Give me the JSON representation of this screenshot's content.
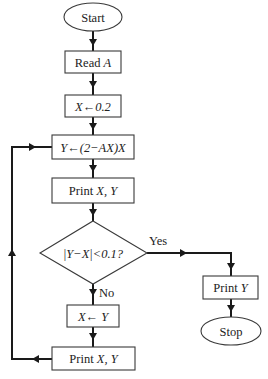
{
  "diagram": {
    "type": "flowchart",
    "nodes": {
      "start": {
        "shape": "terminal",
        "label": "Start"
      },
      "read_a": {
        "shape": "process",
        "label_prefix": "Read ",
        "label_var": "A"
      },
      "init_x": {
        "shape": "process",
        "label": "X←0.2"
      },
      "compute_y": {
        "shape": "process",
        "label": "Y←(2−AX)X"
      },
      "print_xy_1": {
        "shape": "process",
        "label_prefix": "Print ",
        "label_var": "X, Y"
      },
      "decision": {
        "shape": "decision",
        "label": "|Y−X|<0.1?"
      },
      "assign_x": {
        "shape": "process",
        "label": "X← Y"
      },
      "print_xy_2": {
        "shape": "process",
        "label_prefix": "Print ",
        "label_var": "X, Y"
      },
      "print_y": {
        "shape": "process",
        "label_prefix": "Print ",
        "label_var": "Y"
      },
      "stop": {
        "shape": "terminal",
        "label": "Stop"
      }
    },
    "edges": {
      "yes_label": "Yes",
      "no_label": "No"
    },
    "edge_list": [
      [
        "start",
        "read_a"
      ],
      [
        "read_a",
        "init_x"
      ],
      [
        "init_x",
        "compute_y"
      ],
      [
        "compute_y",
        "print_xy_1"
      ],
      [
        "print_xy_1",
        "decision"
      ],
      [
        "decision",
        "print_y",
        "Yes"
      ],
      [
        "decision",
        "assign_x",
        "No"
      ],
      [
        "assign_x",
        "print_xy_2"
      ],
      [
        "print_xy_2",
        "compute_y"
      ],
      [
        "print_y",
        "stop"
      ]
    ]
  }
}
